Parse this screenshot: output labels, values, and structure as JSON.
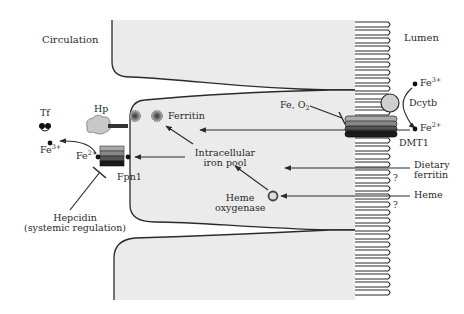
{
  "diagram": {
    "type": "enterocyte iron absorption schematic",
    "regions": {
      "left": "Circulation",
      "right": "Lumen"
    },
    "labels": {
      "circulation": "Circulation",
      "lumen": "Lumen",
      "tf": "Tf",
      "hp": "Hp",
      "ferritin": "Ferritin",
      "fe3_left_base": "Fe",
      "fe3_left_sup": "3+",
      "fe2_left_base": "Fe",
      "fe2_left_sup": "2+",
      "fpn1": "Fpn1",
      "hepcidin_line1": "Hepcidin",
      "hepcidin_line2": "(systemic regulation)",
      "pool_line1": "Intracellular",
      "pool_line2": "iron pool",
      "heme_oxy_line1": "Heme",
      "heme_oxy_line2": "oxygenase",
      "fe_o2_base": "Fe, O",
      "fe_o2_sub": "2",
      "dmt1": "DMT1",
      "dcytb": "Dcytb",
      "fe3_right_base": "Fe",
      "fe3_right_sup": "3+",
      "fe2_right_base": "Fe",
      "fe2_right_sup": "2+",
      "dietary_line1": "Dietary",
      "dietary_line2": "ferritin",
      "heme": "Heme",
      "question1": "?",
      "question2": "?"
    },
    "colors": {
      "cell_fill": "#ebebeb",
      "outline": "#2a2a2a",
      "hp_fill": "#c8c8c8",
      "text": "#2a2a2a"
    }
  }
}
